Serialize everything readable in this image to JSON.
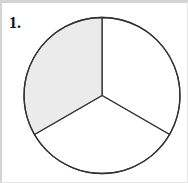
{
  "problem": {
    "number_label": "1."
  },
  "chart_data": {
    "type": "pie",
    "title": "",
    "slices": [
      {
        "label": "sector-1",
        "fraction": 0.3333,
        "start_deg": 0,
        "end_deg": 120,
        "shaded": false
      },
      {
        "label": "sector-2",
        "fraction": 0.3333,
        "start_deg": 120,
        "end_deg": 240,
        "shaded": false
      },
      {
        "label": "sector-3",
        "fraction": 0.3333,
        "start_deg": 240,
        "end_deg": 360,
        "shaded": true
      }
    ],
    "values": [
      1,
      1,
      1
    ],
    "shaded_fraction": "1/3",
    "colors": {
      "shaded_fill": "#ebebeb",
      "unshaded_fill": "#ffffff",
      "stroke": "#333333"
    },
    "legend": "none"
  }
}
